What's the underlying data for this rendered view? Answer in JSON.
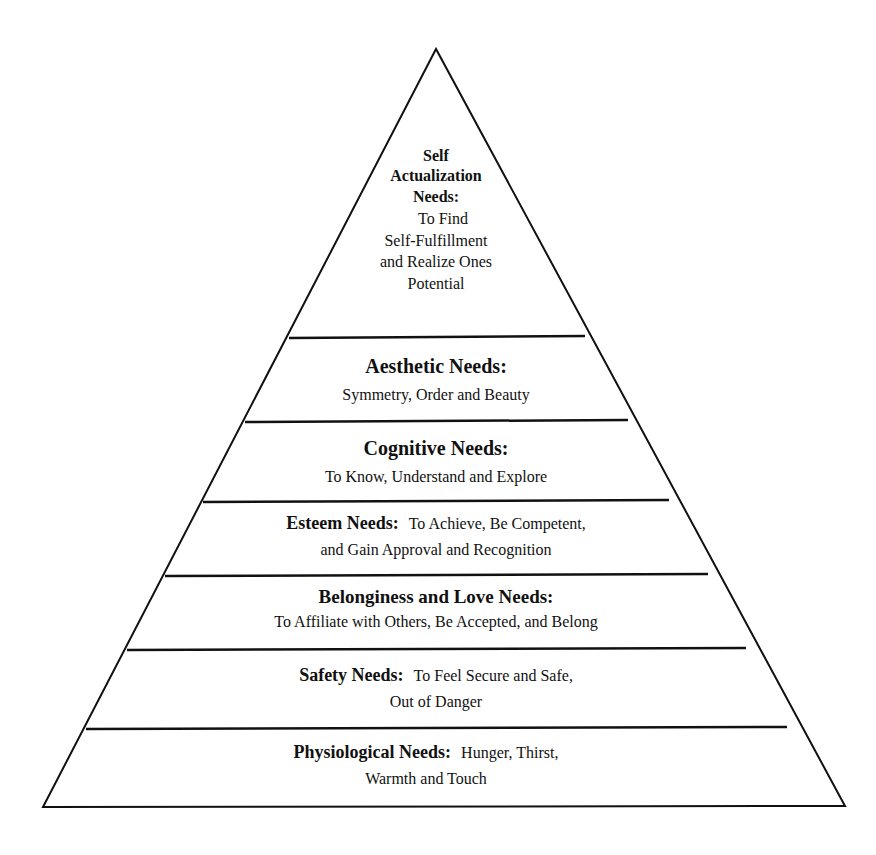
{
  "diagram": {
    "type": "pyramid",
    "levels": [
      {
        "id": "self-actualization",
        "title_lines": [
          "Self",
          "Actualization",
          "Needs:"
        ],
        "desc_lines": [
          "To Find",
          "Self-Fulfillment",
          "and Realize Ones",
          "Potential"
        ]
      },
      {
        "id": "aesthetic",
        "title": "Aesthetic Needs:",
        "desc": "Symmetry, Order and Beauty"
      },
      {
        "id": "cognitive",
        "title": "Cognitive Needs:",
        "desc": "To Know, Understand and Explore"
      },
      {
        "id": "esteem",
        "title": "Esteem Needs:",
        "desc_inline": "To Achieve, Be Competent,",
        "desc": "and Gain Approval and Recognition"
      },
      {
        "id": "belonging",
        "title": "Belonginess and Love Needs:",
        "desc": "To Affiliate with Others, Be Accepted, and Belong"
      },
      {
        "id": "safety",
        "title": "Safety Needs:",
        "desc_inline": "To Feel Secure and Safe,",
        "desc": "Out of Danger"
      },
      {
        "id": "physiological",
        "title": "Physiological Needs:",
        "desc_inline": "Hunger, Thirst,",
        "desc": "Warmth and Touch"
      }
    ]
  }
}
